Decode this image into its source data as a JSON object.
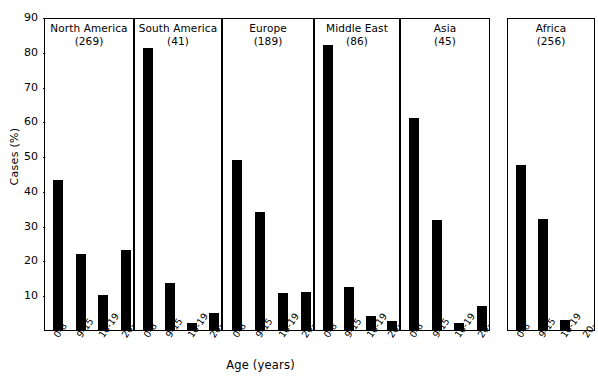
{
  "chart_data": {
    "type": "bar",
    "title": "",
    "xlabel": "Age (years)",
    "ylabel": "Cases (%)",
    "ylim": [
      0,
      90
    ],
    "yticks": [
      10,
      20,
      30,
      40,
      50,
      60,
      70,
      80,
      90
    ],
    "grid": false,
    "legend": "none",
    "categories": [
      "0-8",
      "9-15",
      "16-19",
      "20-"
    ],
    "panels": [
      {
        "name": "North America",
        "count_label": "(269)",
        "count": 269,
        "values": [
          43,
          22,
          10,
          23
        ]
      },
      {
        "name": "South America",
        "count_label": "(41)",
        "count": 41,
        "values": [
          81,
          13.5,
          2,
          5
        ]
      },
      {
        "name": "Europe",
        "count_label": "(189)",
        "count": 189,
        "values": [
          49,
          34,
          10.5,
          11
        ]
      },
      {
        "name": "Middle East",
        "count_label": "(86)",
        "count": 86,
        "values": [
          82,
          12.5,
          4,
          2.5
        ]
      },
      {
        "name": "Asia",
        "count_label": "(45)",
        "count": 45,
        "values": [
          61,
          31.5,
          2,
          7
        ]
      },
      {
        "name": "Africa",
        "count_label": "(256)",
        "count": 256,
        "values": [
          47.5,
          32,
          3,
          0
        ]
      }
    ]
  },
  "axes": {
    "ylabel": "Cases (%)",
    "xlabel": "Age (years)",
    "ytick_labels": [
      "90",
      "80",
      "70",
      "60",
      "50",
      "40",
      "30",
      "20",
      "10"
    ],
    "xtick_labels": [
      "0-8",
      "9-15",
      "16-19",
      "20-"
    ]
  },
  "colors": {
    "bar": "#000000",
    "axis": "#000000",
    "background": "#ffffff"
  }
}
